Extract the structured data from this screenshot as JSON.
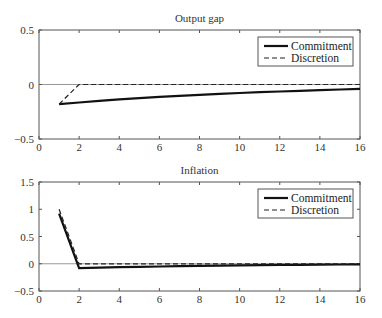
{
  "chart_data": [
    {
      "type": "line",
      "title": "Output gap",
      "xlabel": "",
      "ylabel": "",
      "xlim": [
        0,
        16
      ],
      "ylim": [
        -0.5,
        0.5
      ],
      "xticks": [
        0,
        2,
        4,
        6,
        8,
        10,
        12,
        14,
        16
      ],
      "yticks": [
        -0.5,
        0,
        0.5
      ],
      "ytick_labels": [
        "−0.5",
        "0",
        "0.5"
      ],
      "zero_line": true,
      "grid": false,
      "legend_position": "upper right",
      "series": [
        {
          "name": "Commitment",
          "style": "solid",
          "x": [
            1,
            2,
            3,
            4,
            5,
            6,
            7,
            8,
            9,
            10,
            11,
            12,
            13,
            14,
            15,
            16
          ],
          "y": [
            -0.18,
            -0.165,
            -0.15,
            -0.137,
            -0.125,
            -0.114,
            -0.104,
            -0.095,
            -0.086,
            -0.078,
            -0.071,
            -0.064,
            -0.058,
            -0.052,
            -0.046,
            -0.04
          ]
        },
        {
          "name": "Discretion",
          "style": "dashed",
          "x": [
            1,
            2,
            3,
            4,
            5,
            6,
            7,
            8,
            9,
            10,
            11,
            12,
            13,
            14,
            15,
            16
          ],
          "y": [
            -0.18,
            0,
            0,
            0,
            0,
            0,
            0,
            0,
            0,
            0,
            0,
            0,
            0,
            0,
            0,
            0
          ]
        }
      ]
    },
    {
      "type": "line",
      "title": "Inflation",
      "xlabel": "",
      "ylabel": "",
      "xlim": [
        0,
        16
      ],
      "ylim": [
        -0.5,
        1.5
      ],
      "xticks": [
        0,
        2,
        4,
        6,
        8,
        10,
        12,
        14,
        16
      ],
      "yticks": [
        -0.5,
        0,
        0.5,
        1,
        1.5
      ],
      "ytick_labels": [
        "−0.5",
        "0",
        "0.5",
        "1",
        "1.5"
      ],
      "zero_line": true,
      "grid": false,
      "legend_position": "upper right",
      "series": [
        {
          "name": "Commitment",
          "style": "solid",
          "x": [
            1,
            2,
            3,
            4,
            5,
            6,
            7,
            8,
            9,
            10,
            11,
            12,
            13,
            14,
            15,
            16
          ],
          "y": [
            0.92,
            -0.08,
            -0.072,
            -0.064,
            -0.057,
            -0.05,
            -0.044,
            -0.039,
            -0.034,
            -0.03,
            -0.026,
            -0.022,
            -0.019,
            -0.016,
            -0.013,
            -0.01
          ]
        },
        {
          "name": "Discretion",
          "style": "dashed",
          "x": [
            1,
            2,
            3,
            4,
            5,
            6,
            7,
            8,
            9,
            10,
            11,
            12,
            13,
            14,
            15,
            16
          ],
          "y": [
            1.0,
            0,
            0,
            0,
            0,
            0,
            0,
            0,
            0,
            0,
            0,
            0,
            0,
            0,
            0,
            0
          ]
        }
      ]
    }
  ],
  "legend": {
    "commitment_label": "Commitment",
    "discretion_label": "Discretion"
  },
  "colors": {
    "commitment": "#111111",
    "discretion": "#222222",
    "axes": "#555555",
    "zero_line": "#999999"
  }
}
